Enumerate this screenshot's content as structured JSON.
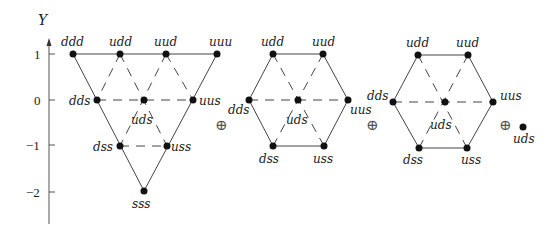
{
  "axis": {
    "label": "Y",
    "ticks": [
      {
        "label": "1",
        "value": 1
      },
      {
        "label": "0",
        "value": 0
      },
      {
        "label": "−1",
        "value": -1
      },
      {
        "label": "−2",
        "value": -2
      }
    ]
  },
  "decuplet": {
    "labels": {
      "ddd": "ddd",
      "udd": "udd",
      "uud": "uud",
      "uuu": "uuu",
      "dds": "dds",
      "uds": "uds",
      "uus": "uus",
      "dss": "dss",
      "uss": "uss",
      "sss": "sss"
    }
  },
  "octet1": {
    "labels": {
      "udd": "udd",
      "uud": "uud",
      "dds": "dds",
      "uds": "uds",
      "uus": "uus",
      "dss": "dss",
      "uss": "uss"
    }
  },
  "octet2": {
    "labels": {
      "udd": "udd",
      "uud": "uud",
      "dds": "dds",
      "uds": "uds",
      "uus": "uus",
      "dss": "dss",
      "uss": "uss"
    }
  },
  "singlet": {
    "label": "uds"
  },
  "operators": [
    "⊕",
    "⊕",
    "⊕"
  ]
}
